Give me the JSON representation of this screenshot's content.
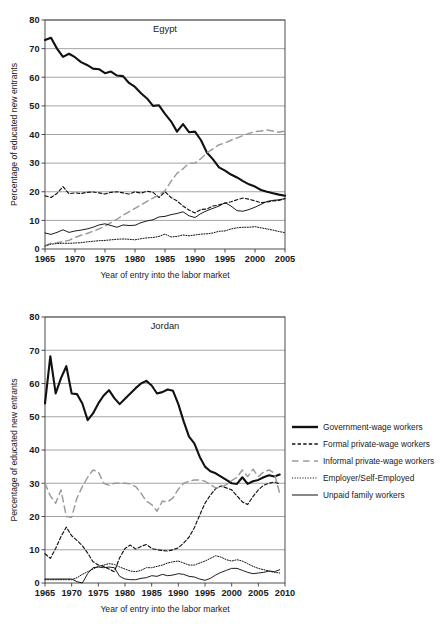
{
  "figure": {
    "axis_x_label": "Year of entry into the labor market",
    "axis_y_label": "Percentage of educated new entrants"
  },
  "legend": {
    "position": "right",
    "items": [
      {
        "label": "Government-wage workers",
        "key": "government",
        "style": "solid-thick",
        "color": "#111111"
      },
      {
        "label": "Formal private-wage workers",
        "key": "formal",
        "style": "dashed-short",
        "color": "#111111"
      },
      {
        "label": "Informal private-wage workers",
        "key": "informal",
        "style": "dashed-long",
        "color": "#9a9a9a"
      },
      {
        "label": "Employer/Self-Employed",
        "key": "employer",
        "style": "dotted",
        "color": "#111111"
      },
      {
        "label": "Unpaid family workers",
        "key": "unpaid",
        "style": "solid-thin",
        "color": "#111111"
      }
    ]
  },
  "chart_data": [
    {
      "type": "line",
      "title": "Egypt",
      "xlabel": "Year of entry into the labor market",
      "ylabel": "Percentage of educated new entrants",
      "xlim": [
        1965,
        2005
      ],
      "ylim": [
        0,
        80
      ],
      "xticks": [
        1965,
        1970,
        1975,
        1980,
        1985,
        1990,
        1995,
        2000,
        2005
      ],
      "yticks": [
        0,
        10,
        20,
        30,
        40,
        50,
        60,
        70,
        80
      ],
      "grid": "horizontal",
      "x": [
        1965,
        1966,
        1967,
        1968,
        1969,
        1970,
        1971,
        1972,
        1973,
        1974,
        1975,
        1976,
        1977,
        1978,
        1979,
        1980,
        1981,
        1982,
        1983,
        1984,
        1985,
        1986,
        1987,
        1988,
        1989,
        1990,
        1991,
        1992,
        1993,
        1994,
        1995,
        1996,
        1997,
        1998,
        1999,
        2000,
        2001,
        2002,
        2003,
        2004,
        2005
      ],
      "series": [
        {
          "name": "Government-wage workers",
          "key": "government",
          "values": [
            73.0,
            73.8,
            70.0,
            67.1,
            68.2,
            67.0,
            65.3,
            64.3,
            63.0,
            62.8,
            61.4,
            62.0,
            60.6,
            60.4,
            58.0,
            56.6,
            54.4,
            52.6,
            50.0,
            50.2,
            47.2,
            44.6,
            41.0,
            43.6,
            40.8,
            41.0,
            38.0,
            33.6,
            31.3,
            28.5,
            27.4,
            26.0,
            25.0,
            23.7,
            22.6,
            21.8,
            20.6,
            20.0,
            19.5,
            19.0,
            18.6
          ]
        },
        {
          "name": "Formal private-wage workers",
          "key": "formal",
          "values": [
            18.6,
            18.0,
            19.4,
            21.8,
            19.3,
            19.6,
            19.4,
            19.8,
            19.9,
            19.6,
            19.2,
            19.8,
            20.0,
            19.6,
            19.2,
            20.0,
            19.5,
            20.2,
            19.8,
            18.0,
            20.0,
            18.0,
            16.8,
            15.0,
            13.6,
            12.6,
            13.8,
            14.0,
            15.0,
            15.4,
            16.0,
            16.5,
            17.2,
            17.8,
            17.4,
            16.8,
            16.2,
            16.4,
            16.8,
            17.0,
            17.6
          ]
        },
        {
          "name": "Informal private-wage workers",
          "key": "informal",
          "values": [
            1.2,
            2.0,
            2.2,
            2.6,
            3.0,
            4.0,
            4.8,
            5.4,
            6.2,
            7.0,
            8.0,
            9.2,
            10.4,
            11.8,
            13.0,
            14.2,
            15.4,
            16.6,
            17.8,
            19.0,
            20.4,
            23.6,
            26.4,
            28.0,
            30.0,
            30.0,
            31.6,
            33.6,
            35.0,
            36.4,
            37.0,
            38.0,
            38.8,
            39.6,
            40.4,
            41.0,
            41.2,
            41.6,
            41.2,
            40.8,
            41.2
          ]
        },
        {
          "name": "Employer/Self-Employed",
          "key": "employer",
          "values": [
            1.0,
            1.7,
            1.9,
            2.0,
            2.0,
            2.1,
            2.2,
            2.5,
            2.7,
            2.9,
            3.0,
            3.2,
            3.4,
            3.5,
            3.4,
            3.2,
            3.6,
            3.9,
            4.0,
            4.4,
            5.2,
            4.2,
            4.4,
            4.9,
            4.6,
            4.9,
            5.2,
            5.3,
            5.6,
            6.2,
            6.3,
            7.0,
            7.4,
            7.6,
            7.6,
            7.8,
            7.4,
            7.0,
            6.6,
            6.1,
            5.7
          ]
        },
        {
          "name": "Unpaid family workers",
          "key": "unpaid",
          "values": [
            5.6,
            5.1,
            5.8,
            6.7,
            5.8,
            6.3,
            6.6,
            7.0,
            7.6,
            8.4,
            8.8,
            8.2,
            7.6,
            8.4,
            8.2,
            8.3,
            9.2,
            9.8,
            10.2,
            11.2,
            11.4,
            12.0,
            12.4,
            13.0,
            11.6,
            11.0,
            12.4,
            13.4,
            14.2,
            15.0,
            16.2,
            15.0,
            13.4,
            13.2,
            13.8,
            14.6,
            15.6,
            16.6,
            17.0,
            17.2,
            17.6
          ]
        }
      ]
    },
    {
      "type": "line",
      "title": "Jordan",
      "xlabel": "Year of entry into the labor market",
      "ylabel": "Percentage of educated new entrants",
      "xlim": [
        1965,
        2010
      ],
      "ylim": [
        0,
        80
      ],
      "xticks": [
        1965,
        1970,
        1975,
        1980,
        1985,
        1990,
        1995,
        2000,
        2005,
        2010
      ],
      "yticks": [
        0,
        10,
        20,
        30,
        40,
        50,
        60,
        70,
        80
      ],
      "grid": "horizontal",
      "x": [
        1965,
        1966,
        1967,
        1968,
        1969,
        1970,
        1971,
        1972,
        1973,
        1974,
        1975,
        1976,
        1977,
        1978,
        1979,
        1980,
        1981,
        1982,
        1983,
        1984,
        1985,
        1986,
        1987,
        1988,
        1989,
        1990,
        1991,
        1992,
        1993,
        1994,
        1995,
        1996,
        1997,
        1998,
        1999,
        2000,
        2001,
        2002,
        2003,
        2004,
        2005,
        2006,
        2007,
        2008,
        2009
      ],
      "series": [
        {
          "name": "Government-wage workers",
          "key": "government",
          "values": [
            54.0,
            68.2,
            57.0,
            61.6,
            65.2,
            57.0,
            56.8,
            54.0,
            49.0,
            51.0,
            54.0,
            56.4,
            58.0,
            55.6,
            53.8,
            55.4,
            57.0,
            58.6,
            60.0,
            60.8,
            59.4,
            57.0,
            57.4,
            58.2,
            57.8,
            53.8,
            48.6,
            44.0,
            42.0,
            38.0,
            35.0,
            33.6,
            33.0,
            32.0,
            31.0,
            30.0,
            29.8,
            31.8,
            29.8,
            30.6,
            31.0,
            31.8,
            32.4,
            32.0,
            32.6
          ]
        },
        {
          "name": "Formal private-wage workers",
          "key": "formal",
          "values": [
            8.8,
            7.4,
            10.4,
            14.0,
            16.8,
            14.2,
            12.8,
            11.2,
            9.0,
            6.4,
            5.4,
            5.0,
            4.2,
            3.4,
            7.6,
            10.4,
            11.4,
            10.2,
            11.0,
            11.6,
            10.4,
            10.0,
            9.8,
            9.6,
            10.0,
            10.6,
            12.0,
            13.8,
            16.6,
            20.4,
            24.0,
            26.4,
            28.4,
            29.2,
            28.6,
            28.0,
            26.2,
            24.4,
            23.6,
            26.0,
            28.0,
            29.4,
            30.0,
            30.4,
            29.8
          ]
        },
        {
          "name": "Informal private-wage workers",
          "key": "informal",
          "values": [
            30.0,
            26.2,
            24.0,
            28.0,
            20.0,
            19.8,
            25.6,
            29.0,
            31.8,
            34.0,
            33.4,
            30.0,
            29.4,
            30.0,
            30.0,
            30.0,
            29.8,
            29.0,
            27.0,
            24.6,
            23.6,
            21.6,
            24.6,
            24.4,
            25.6,
            28.2,
            30.0,
            30.6,
            31.0,
            31.0,
            30.6,
            29.6,
            28.6,
            28.8,
            29.6,
            30.8,
            31.8,
            34.0,
            32.0,
            34.2,
            32.0,
            33.4,
            34.0,
            33.0,
            27.0
          ]
        },
        {
          "name": "Employer/Self-Employed",
          "key": "employer",
          "values": [
            1.0,
            1.0,
            1.0,
            1.0,
            1.0,
            1.0,
            1.6,
            2.6,
            3.4,
            4.2,
            5.0,
            5.4,
            5.8,
            5.6,
            4.8,
            4.2,
            3.6,
            3.4,
            3.8,
            4.6,
            4.6,
            5.0,
            5.4,
            6.0,
            6.4,
            6.6,
            6.0,
            5.4,
            5.4,
            6.0,
            6.6,
            7.4,
            8.2,
            7.8,
            7.0,
            6.6,
            7.0,
            6.6,
            5.8,
            5.0,
            4.4,
            4.0,
            3.6,
            3.2,
            3.0
          ]
        },
        {
          "name": "Unpaid family workers",
          "key": "unpaid",
          "values": [
            1.2,
            1.2,
            1.2,
            1.2,
            1.2,
            1.2,
            0.4,
            0.0,
            2.8,
            4.6,
            4.8,
            4.6,
            4.8,
            4.6,
            2.0,
            1.2,
            1.0,
            1.0,
            1.4,
            1.6,
            2.2,
            2.0,
            2.6,
            2.2,
            2.4,
            2.8,
            2.6,
            2.0,
            1.8,
            1.2,
            0.8,
            1.4,
            2.4,
            3.2,
            3.8,
            4.4,
            4.4,
            3.8,
            3.2,
            2.8,
            3.0,
            3.2,
            3.6,
            3.4,
            4.0
          ]
        }
      ]
    }
  ]
}
